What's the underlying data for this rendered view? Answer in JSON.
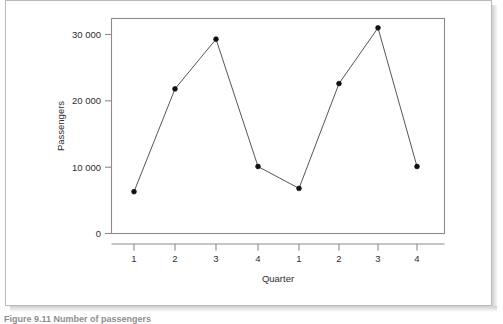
{
  "figure": {
    "caption": "Figure 9.11  Number of passengers"
  },
  "chart_data": {
    "type": "line",
    "title": "",
    "xlabel": "Quarter",
    "ylabel": "Passengers",
    "categories": [
      "1",
      "2",
      "3",
      "4",
      "1",
      "2",
      "3",
      "4"
    ],
    "values": [
      6300,
      21800,
      29300,
      10100,
      6800,
      22600,
      31000,
      10100
    ],
    "series": [
      {
        "name": "Passengers",
        "values": [
          6300,
          21800,
          29300,
          10100,
          6800,
          22600,
          31000,
          10100
        ]
      }
    ],
    "ylim": [
      0,
      33000
    ],
    "yticks": [
      0,
      10000,
      20000,
      30000
    ],
    "ytick_labels": [
      "0",
      "10 000",
      "20 000",
      "30 000"
    ],
    "xticks": [
      1,
      2,
      3,
      4,
      5,
      6,
      7,
      8
    ],
    "xtick_labels": [
      "1",
      "2",
      "3",
      "4",
      "1",
      "2",
      "3",
      "4"
    ],
    "grid": false,
    "legend": "none",
    "marker": "filled-circle",
    "line_color": "#555555",
    "marker_color": "#111111",
    "frame_color": "#8b8b8b"
  },
  "axis": {
    "y_title": "Passengers",
    "x_title": "Quarter",
    "y_labels": [
      "30 000",
      "20 000",
      "10 000",
      "0"
    ],
    "x_labels": [
      "1",
      "2",
      "3",
      "4",
      "1",
      "2",
      "3",
      "4"
    ]
  }
}
